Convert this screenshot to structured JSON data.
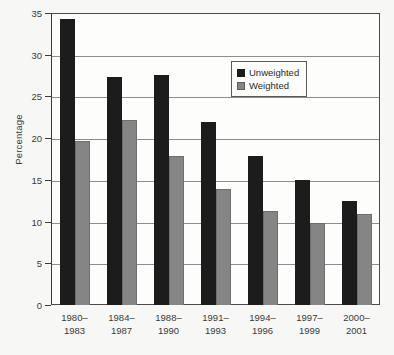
{
  "chart_data": {
    "type": "bar",
    "title": "",
    "xlabel": "",
    "ylabel": "Percentage",
    "ylim": [
      0,
      35
    ],
    "ytick_step": 5,
    "yticks": [
      0,
      5,
      10,
      15,
      20,
      25,
      30,
      35
    ],
    "grid": true,
    "grid_axis": "y",
    "legend_position": "upper right inside plot",
    "categories": [
      "1980–\n1983",
      "1984–\n1987",
      "1988–\n1990",
      "1991–\n1993",
      "1994–\n1996",
      "1997–\n1999",
      "2000–\n2001"
    ],
    "category_lines": [
      [
        "1980–",
        "1983"
      ],
      [
        "1984–",
        "1987"
      ],
      [
        "1988–",
        "1990"
      ],
      [
        "1991–",
        "1993"
      ],
      [
        "1994–",
        "1996"
      ],
      [
        "1997–",
        "1999"
      ],
      [
        "2000–",
        "2001"
      ]
    ],
    "series": [
      {
        "name": "Unweighted",
        "color": "#1c1c1c",
        "values": [
          34.3,
          27.3,
          27.6,
          21.9,
          17.9,
          15.0,
          12.5
        ]
      },
      {
        "name": "Weighted",
        "color": "#858585",
        "values": [
          19.7,
          22.2,
          17.9,
          13.9,
          11.3,
          9.8,
          10.9
        ]
      }
    ]
  },
  "legend": {
    "items": [
      {
        "label": "Unweighted",
        "swatch": "unweighted"
      },
      {
        "label": "Weighted",
        "swatch": "weighted"
      }
    ]
  }
}
